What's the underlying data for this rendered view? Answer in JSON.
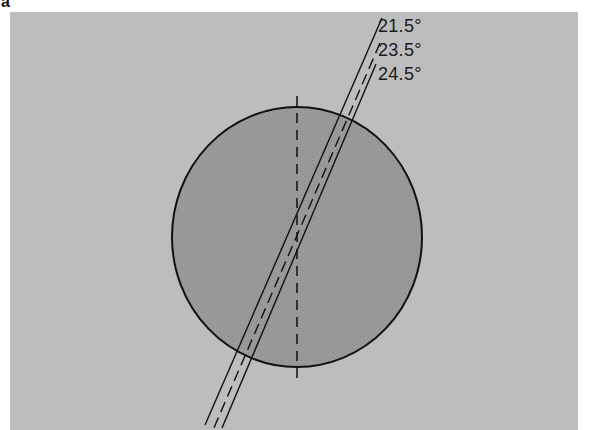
{
  "figure": {
    "panel_label": "a",
    "colors": {
      "background": "#bdbdbd",
      "sphere_fill": "#9a9a9a",
      "line": "#111111"
    },
    "angles": [
      {
        "label": "21.5°",
        "value": 21.5,
        "style": "solid"
      },
      {
        "label": "23.5°",
        "value": 23.5,
        "style": "dashed"
      },
      {
        "label": "24.5°",
        "value": 24.5,
        "style": "solid"
      }
    ],
    "reference_axis": {
      "style": "dashed",
      "orientation": "vertical"
    }
  }
}
